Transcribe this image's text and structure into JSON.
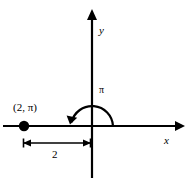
{
  "figure": {
    "type": "polar-coordinate-diagram",
    "background_color": "#ffffff",
    "stroke_color": "#000000",
    "labels": {
      "y_axis": "y",
      "x_axis": "x",
      "angle": "π",
      "point": "(2, π)",
      "dimension": "2"
    },
    "geometry": {
      "origin": {
        "x": 92,
        "y": 126
      },
      "x_axis": {
        "x1": 3,
        "y1": 126,
        "x2": 185,
        "y2": 126,
        "arrow_end": "right"
      },
      "y_axis": {
        "x1": 92,
        "y1": 10,
        "x2": 92,
        "y2": 178,
        "arrow_end": "top"
      },
      "point": {
        "x": 24,
        "y": 126,
        "radius": 5
      },
      "arc": {
        "cx": 92,
        "cy": 126,
        "r": 21,
        "start_angle_deg": 0,
        "end_angle_deg": 180,
        "direction": "counterclockwise",
        "arrow_end": "terminal"
      },
      "dimension_line": {
        "x1": 24,
        "x2": 90,
        "y": 143,
        "arrows": "both"
      }
    }
  }
}
